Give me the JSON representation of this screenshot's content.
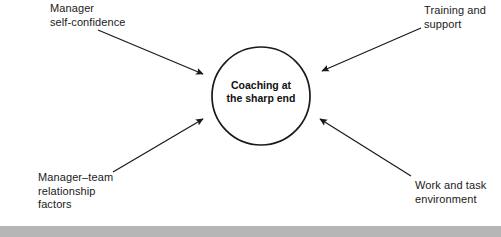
{
  "figure": {
    "width": 501,
    "height": 237,
    "background": "#ffffff",
    "stroke_color": "#1a1a1a",
    "text_color": "#1a1a1a"
  },
  "center_node": {
    "name": "coaching-at-the-sharp-end",
    "label": "Coaching at\nthe sharp end",
    "shape": "circle",
    "cx": 261,
    "cy": 96,
    "r": 49
  },
  "factors": [
    {
      "name": "manager-self-confidence",
      "label": "Manager\nself-confidence",
      "position": "top-left"
    },
    {
      "name": "training-and-support",
      "label": "Training and\nsupport",
      "position": "top-right"
    },
    {
      "name": "manager-team-relationship-factors",
      "label": "Manager–team\nrelationship\nfactors",
      "position": "bottom-left"
    },
    {
      "name": "work-and-task-environment",
      "label": "Work and task\nenvironment",
      "position": "bottom-right"
    }
  ],
  "arrows": [
    {
      "name": "arrow-manager-self-confidence",
      "from": [
        98,
        30
      ],
      "to": [
        205,
        75
      ]
    },
    {
      "name": "arrow-training-and-support",
      "from": [
        421,
        28
      ],
      "to": [
        320,
        72
      ]
    },
    {
      "name": "arrow-manager-team-relationship",
      "from": [
        113,
        172
      ],
      "to": [
        204,
        117
      ]
    },
    {
      "name": "arrow-work-and-task-environment",
      "from": [
        411,
        176
      ],
      "to": [
        318,
        117
      ]
    }
  ],
  "caption_bar": {
    "name": "caption-bar",
    "text": "",
    "background": "#b6b6b6"
  }
}
